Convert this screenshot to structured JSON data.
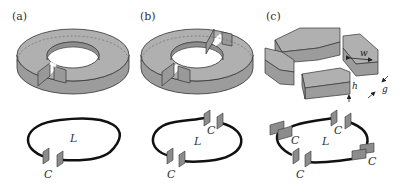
{
  "figure": {
    "colors": {
      "resonator_fill": "#a8a8a8",
      "resonator_top": "#b4b4b4",
      "edge": "#333333",
      "wire": "#111111",
      "capacitor_fill": "#8c8c8c"
    },
    "panels": [
      {
        "id": "a",
        "label": "(a)",
        "description": "Split-ring resonator with one gap",
        "circuit": {
          "inductor_label": "L",
          "capacitor_labels": [
            "C"
          ]
        }
      },
      {
        "id": "b",
        "label": "(b)",
        "description": "Ring resonator with two gaps",
        "circuit": {
          "inductor_label": "L",
          "capacitor_labels": [
            "C",
            "C"
          ]
        }
      },
      {
        "id": "c",
        "label": "(c)",
        "description": "Ring resonator with four gaps",
        "dimensions": {
          "width": "w",
          "gap": "g",
          "height": "h"
        },
        "circuit": {
          "inductor_label": "L",
          "capacitor_labels": [
            "C",
            "C",
            "C",
            "C"
          ]
        }
      }
    ]
  }
}
